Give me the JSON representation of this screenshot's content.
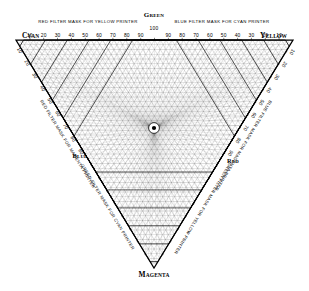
{
  "chart_data": {
    "type": "line",
    "subtitle": "Tri-linear masking chart for three-colour process printing",
    "xlabel": "",
    "ylabel": "",
    "grid": true,
    "legend_position": "none",
    "geometry": {
      "shape": "inverted-equilateral-triangle",
      "vertices": [
        {
          "name": "CYAN",
          "corner": "top-left",
          "x": 16,
          "y": 40
        },
        {
          "name": "YELLOW",
          "corner": "top-right",
          "x": 293,
          "y": 40
        },
        {
          "name": "MAGENTA",
          "corner": "bottom-apex",
          "x": 154,
          "y": 268
        }
      ],
      "center_node": {
        "x": 154,
        "y": 128,
        "label": "convergence"
      },
      "contour_rings": 6,
      "ray_families": 3,
      "rays_per_family": 48
    },
    "primaries": [
      "CYAN",
      "YELLOW",
      "MAGENTA"
    ],
    "secondaries": [
      "GREEN",
      "BLUE",
      "RED"
    ],
    "scale_min": 0,
    "scale_max": 100,
    "tick_step": 10,
    "axes": [
      {
        "name": "top-left-half",
        "from": "CYAN",
        "to": "GREEN",
        "caption": "RED FILTER MASK FOR YELLOW PRINTER",
        "ticks": [
          10,
          20,
          30,
          40,
          50,
          60,
          70,
          80,
          90,
          100
        ]
      },
      {
        "name": "top-right-half",
        "from": "GREEN",
        "to": "YELLOW",
        "caption": "BLUE FILTER MASK FOR CYAN PRINTER",
        "ticks": [
          90,
          80,
          70,
          60,
          50,
          40,
          30,
          20,
          10
        ]
      },
      {
        "name": "left-edge",
        "from": "CYAN",
        "to": "BLUE",
        "caption": "RED FILTER MASK FOR MAGENTA PRINTER",
        "ticks": [
          10,
          20,
          30,
          40,
          50,
          60,
          70,
          80,
          90
        ]
      },
      {
        "name": "right-edge",
        "from": "YELLOW",
        "to": "RED",
        "caption": "BLUE FILTER MASK FOR MAGENTA PRINTER",
        "ticks": [
          10,
          20,
          30,
          40,
          50,
          60,
          70,
          80,
          90
        ]
      },
      {
        "name": "lower-left-edge",
        "from": "BLUE",
        "to": "MAGENTA",
        "caption": "GREEN FILTER MASK FOR CYAN PRINTER",
        "ticks": [
          90,
          80,
          70,
          60,
          50,
          40,
          30,
          20,
          10
        ]
      },
      {
        "name": "lower-right-edge",
        "from": "MAGENTA",
        "to": "RED",
        "caption": "GREEN FILTER MASK FOR YELLOW PRINTER",
        "ticks": [
          10,
          20,
          30,
          40,
          50,
          60,
          70,
          80,
          90
        ]
      }
    ],
    "top_scale_left": {
      "caption": "RED FILTER MASK FOR YELLOW PRINTER",
      "values": [
        10,
        20,
        30,
        40,
        50,
        60,
        70,
        80,
        90,
        100
      ]
    },
    "top_scale_right": {
      "caption": "BLUE FILTER MASK FOR CYAN PRINTER",
      "values": [
        90,
        80,
        70,
        60,
        50,
        40,
        30,
        20,
        10
      ]
    },
    "ink_colors": {
      "cyan": "#00a8c8",
      "magenta": "#c8006e",
      "yellow": "#e8c000",
      "red": "#c82020",
      "green": "#209040",
      "blue": "#2030a0"
    }
  },
  "labels": {
    "cyan": "CYAN",
    "yellow": "YELLOW",
    "magenta": "MAGENTA",
    "green": "GREEN",
    "blue": "BLUE",
    "red": "RED",
    "top_center_value": "100"
  },
  "captions": {
    "top_left": "RED FILTER MASK FOR YELLOW PRINTER",
    "top_right": "BLUE FILTER MASK FOR CYAN PRINTER",
    "left_edge": "RED FILTER MASK FOR MAGENTA PRINTER",
    "right_edge": "BLUE FILTER MASK FOR MAGENTA PRINTER",
    "lower_left": "GREEN FILTER MASK FOR CYAN PRINTER",
    "lower_right": "GREEN FILTER MASK FOR YELLOW PRINTER"
  },
  "ticks": {
    "top_left": [
      "10",
      "20",
      "30",
      "40",
      "50",
      "60",
      "70",
      "80",
      "90"
    ],
    "top_right": [
      "90",
      "80",
      "70",
      "60",
      "50",
      "40",
      "30",
      "20",
      "10"
    ],
    "left_edge": [
      "10",
      "20",
      "30",
      "40",
      "50",
      "60",
      "70",
      "80",
      "90"
    ],
    "right_edge": [
      "10",
      "20",
      "30",
      "40",
      "50",
      "60",
      "70",
      "80",
      "90"
    ],
    "lower_left": [
      "90",
      "80",
      "70",
      "60",
      "50",
      "40",
      "30",
      "20",
      "10"
    ],
    "lower_right": [
      "10",
      "20",
      "30",
      "40",
      "50",
      "60",
      "70",
      "80",
      "90"
    ]
  },
  "style": {
    "line_color": "#1a1a1a",
    "contour_color": "#000000",
    "background": "#ffffff"
  }
}
